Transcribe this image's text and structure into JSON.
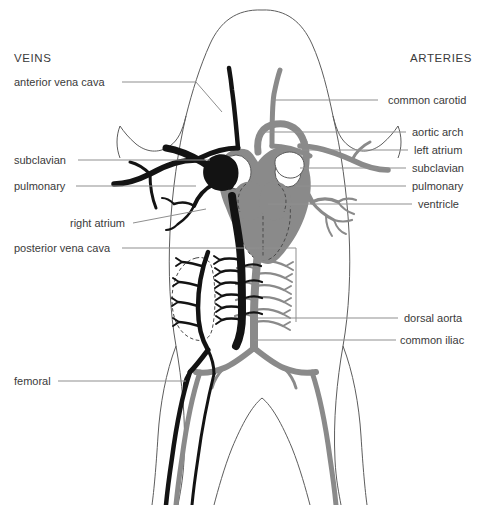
{
  "figure": {
    "title_left": "VEINS",
    "title_right": "ARTERIES",
    "background": "#ffffff",
    "vein_color": "#131313",
    "artery_color": "#8a8a8a",
    "outline_color": "#5d5d5d",
    "leader_color": "#8f8f8f",
    "text_color": "#3a3a3a"
  },
  "labels_left": [
    {
      "text": "anterior vena cava",
      "x": 14,
      "y": 86,
      "line": "M122,82 L196,82 L222,112"
    },
    {
      "text": "subclavian",
      "x": 14,
      "y": 164,
      "line": "M78,160 L210,160"
    },
    {
      "text": "pulmonary",
      "x": 14,
      "y": 190,
      "line": "M76,186 L196,186"
    },
    {
      "text": "right atrium",
      "x": 70,
      "y": 227,
      "line": "M133,223 L206,209"
    },
    {
      "text": "posterior vena cava",
      "x": 14,
      "y": 252,
      "line": "M122,248 L296,248 L296,322"
    },
    {
      "text": "femoral",
      "x": 14,
      "y": 385,
      "line": "M58,381 L186,381"
    }
  ],
  "labels_right": [
    {
      "text": "common carotid",
      "x": 388,
      "y": 104,
      "line": "M378,100 L272,100"
    },
    {
      "text": "aortic arch",
      "x": 412,
      "y": 136,
      "line": "M406,132 L262,132"
    },
    {
      "text": "left atrium",
      "x": 414,
      "y": 154,
      "line": "M408,150 L300,150"
    },
    {
      "text": "subclavian",
      "x": 412,
      "y": 172,
      "line": "M406,168 L300,168"
    },
    {
      "text": "pulmonary",
      "x": 412,
      "y": 190,
      "line": "M406,186 L296,186"
    },
    {
      "text": "ventricle",
      "x": 418,
      "y": 208,
      "line": "M412,204 L268,204"
    },
    {
      "text": "dorsal aorta",
      "x": 404,
      "y": 322,
      "line": "M398,318 L256,318"
    },
    {
      "text": "common iliac",
      "x": 400,
      "y": 344,
      "line": "M396,340 L254,340"
    }
  ],
  "structures": [
    "body-outline",
    "head-outline",
    "kidney-outline-dashed",
    "heart",
    "left-atrium",
    "right-atrium",
    "ventricle",
    "common-carotid-artery",
    "common-carotid-vein",
    "aortic-arch",
    "subclavian-artery",
    "subclavian-vein",
    "pulmonary-artery",
    "pulmonary-vein",
    "anterior-vena-cava",
    "posterior-vena-cava",
    "dorsal-aorta",
    "segmental-arteries",
    "segmental-veins",
    "common-iliac-artery",
    "femoral-artery",
    "femoral-vein"
  ]
}
